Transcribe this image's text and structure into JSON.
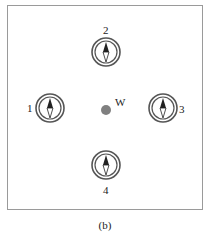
{
  "figure": {
    "caption": "(b)",
    "center_point": {
      "label": "W",
      "color": "#808080"
    },
    "compasses": [
      {
        "id": "1",
        "label": "1",
        "label_side": "left"
      },
      {
        "id": "2",
        "label": "2",
        "label_side": "top"
      },
      {
        "id": "3",
        "label": "3",
        "label_side": "right"
      },
      {
        "id": "4",
        "label": "4",
        "label_side": "bottom"
      }
    ],
    "colors": {
      "ring": "#555555",
      "needle_dark": "#222222",
      "frame": "#9a9a9a"
    }
  }
}
